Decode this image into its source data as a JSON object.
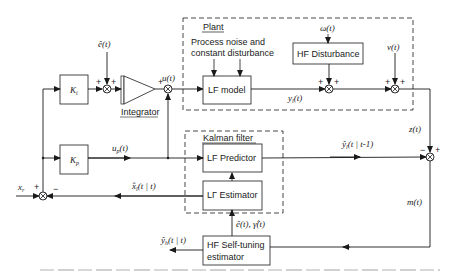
{
  "diagram": {
    "type": "block-diagram",
    "groups": {
      "plant": {
        "label": "Plant"
      },
      "kalman": {
        "label": "Kalman filter"
      }
    },
    "blocks": {
      "ki": "K",
      "ki_sub": "i",
      "kp": "K",
      "kp_sub": "p",
      "integrator": "Integrator",
      "lf_model": "LF model",
      "hf_disturbance": "HF Disturbance",
      "lf_predictor": "LF Predictor",
      "lf_estimator": "LΓ Estimator",
      "hf_selftuning_line1": "HF Self-tuning",
      "hf_selftuning_line2": "estimator"
    },
    "annotations": {
      "process_noise_line1": "Process noise and",
      "process_noise_line2": "constant disturbance"
    },
    "signals": {
      "e_hat": "ê(t)",
      "u": "u(t)",
      "omega": "ω(t)",
      "nu": "v(t)",
      "y_l": "y",
      "y_l_sub": "l",
      "y_l_arg": "(t)",
      "z": "z(t)",
      "up": "u",
      "up_sub": "p",
      "up_arg": "(t)",
      "y_l_hat": "ŷ",
      "y_l_hat_sub": "l",
      "y_l_hat_arg": "(t | t-1)",
      "x_r": "x",
      "x_r_sub": "r",
      "x_l_hat": "x̂",
      "x_l_hat_sub": "l",
      "x_l_hat_arg": "(t | t)",
      "m": "m(t)",
      "e_gamma_hat": "ê(t), γ̂(t)",
      "y_h_hat": "ŷ",
      "y_h_hat_sub": "h",
      "y_h_hat_arg": "(t | t)"
    },
    "signs": {
      "plus": "+",
      "minus": "−"
    }
  }
}
